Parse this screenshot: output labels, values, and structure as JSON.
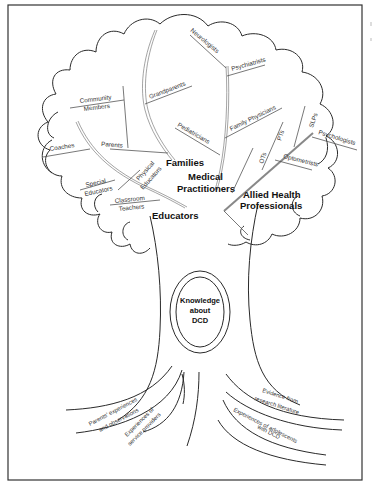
{
  "diagram": {
    "type": "tree-metaphor",
    "core": {
      "line1": "Knowledge",
      "line2": "about",
      "line3": "DCD"
    },
    "groups": {
      "families": {
        "label": "Families",
        "members": {
          "grandparents": "Grandparents",
          "community_members_l1": "Community",
          "community_members_l2": "Members",
          "parents": "Parents",
          "coaches": "Coaches"
        }
      },
      "medical": {
        "label_l1": "Medical",
        "label_l2": "Practitioners",
        "members": {
          "neurologists": "Neurologists",
          "psychiatrists": "Psychiatrists",
          "family_physicians": "Family Physicians",
          "pediatricians": "Pediatricians"
        }
      },
      "allied": {
        "label_l1": "Allied Health",
        "label_l2": "Professionals",
        "members": {
          "ots": "OTs",
          "pts": "PTs",
          "slps": "SLPs",
          "psychologists": "Psychologists",
          "optometrists": "Optometrists"
        }
      },
      "educators": {
        "label": "Educators",
        "members": {
          "special_l1": "Special",
          "special_l2": "Educators",
          "physical_l1": "Physical",
          "physical_l2": "Educators",
          "classroom_l1": "Classroom",
          "classroom_l2": "Teachers"
        }
      }
    },
    "roots": {
      "parents_l1": "Parents' experiences",
      "parents_l2": "and observations",
      "providers_l1": "Experiences of",
      "providers_l2": "service providers",
      "research_l1": "Evidence from",
      "research_l2": "research literature",
      "adolescents_l1": "Experiences of adolescents",
      "adolescents_l2": "with DCD"
    }
  }
}
